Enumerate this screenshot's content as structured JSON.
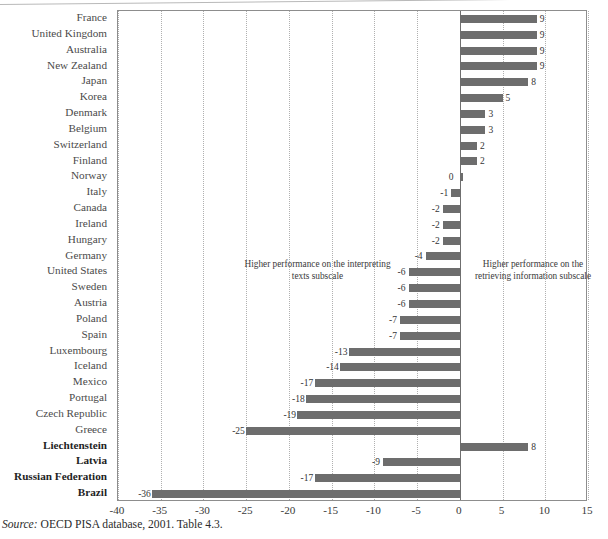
{
  "figure": {
    "source_note_prefix": "Source:",
    "source_note_text": " OECD PISA database, 2001. Table 4.3.",
    "annotation_left": "Higher performance on the interpreting texts subscale",
    "annotation_right": "Higher performance on the retrieving information subscale",
    "bar_color": "#6d6d6d",
    "grid_color": "#b0b0b0",
    "zero_line_color": "#6f6f6f",
    "frame_color": "#8d8d8d"
  },
  "chart_data": {
    "type": "bar",
    "orientation": "horizontal",
    "title": "",
    "xlabel": "",
    "ylabel": "",
    "xlim": [
      -40,
      15
    ],
    "xticks": [
      -40,
      -35,
      -30,
      -25,
      -20,
      -15,
      -10,
      -5,
      0,
      5,
      10,
      15
    ],
    "xtick_labels": [
      "-40",
      "-35",
      "-30",
      "-25",
      "-20",
      "-15",
      "-10",
      "-5",
      "0",
      "5",
      "10",
      "15"
    ],
    "grid": "vertical-dotted",
    "legend": "none",
    "zero_reference_line": 0,
    "annotations": [
      {
        "text": "Higher performance on the interpreting texts subscale",
        "side": "left"
      },
      {
        "text": "Higher performance on the retrieving information subscale",
        "side": "right"
      }
    ],
    "categories": [
      "France",
      "United Kingdom",
      "Australia",
      "New Zealand",
      "Japan",
      "Korea",
      "Denmark",
      "Belgium",
      "Switzerland",
      "Finland",
      "Norway",
      "Italy",
      "Canada",
      "Ireland",
      "Hungary",
      "Germany",
      "United States",
      "Sweden",
      "Austria",
      "Poland",
      "Spain",
      "Luxembourg",
      "Iceland",
      "Mexico",
      "Portugal",
      "Czech Republic",
      "Greece",
      "Liechtenstein",
      "Latvia",
      "Russian Federation",
      "Brazil"
    ],
    "values": [
      9,
      9,
      9,
      9,
      8,
      5,
      3,
      3,
      2,
      2,
      0,
      -1,
      -2,
      -2,
      -2,
      -4,
      -6,
      -6,
      -6,
      -7,
      -7,
      -13,
      -14,
      -17,
      -18,
      -19,
      -25,
      8,
      -9,
      -17,
      -36
    ],
    "value_labels": [
      "9",
      "9",
      "9",
      "9",
      "8",
      "5",
      "3",
      "3",
      "2",
      "2",
      "0",
      "-1",
      "-2",
      "-2",
      "-2",
      "-4",
      "-6",
      "-6",
      "-6",
      "-7",
      "-7",
      "-13",
      "-14",
      "-17",
      "-18",
      "-19",
      "-25",
      "8",
      "-9",
      "-17",
      "-36"
    ],
    "emphasized_categories": [
      "Liechtenstein",
      "Latvia",
      "Russian Federation",
      "Brazil"
    ]
  }
}
